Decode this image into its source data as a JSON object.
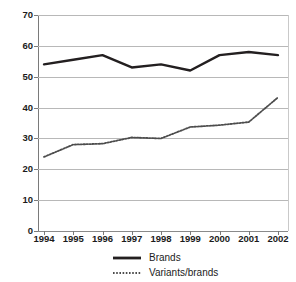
{
  "chart_data": {
    "type": "line",
    "title": "",
    "subtitle": "",
    "xlabel": "",
    "ylabel": "",
    "categories": [
      "1994",
      "1995",
      "1996",
      "1997",
      "1998",
      "1999",
      "2000",
      "2001",
      "2002"
    ],
    "x": [
      1994,
      1995,
      1996,
      1997,
      1998,
      1999,
      2000,
      2001,
      2002
    ],
    "series": [
      {
        "name": "Brands",
        "style": "solid",
        "color": "#231f20",
        "values": [
          54,
          55.5,
          57,
          53,
          54,
          52,
          57,
          58,
          57
        ]
      },
      {
        "name": "Variants/brands",
        "style": "dotted",
        "color": "#4d4d4d",
        "values": [
          24,
          28,
          28.3,
          30.3,
          30,
          33.7,
          34.3,
          35.3,
          43.3
        ]
      }
    ],
    "ylim": [
      0,
      70
    ],
    "yticks": [
      0,
      10,
      20,
      30,
      40,
      50,
      60,
      70
    ],
    "ytick_labels": [
      "0",
      "10",
      "20",
      "30",
      "40",
      "50",
      "60",
      "70"
    ],
    "xtick_labels": [
      "1994",
      "1995",
      "1996",
      "1997",
      "1998",
      "1999",
      "2000",
      "2001",
      "2002"
    ],
    "grid": true,
    "grid_axis": "y",
    "legend_position": "bottom",
    "legend_entries": [
      "Brands",
      "Variants/brands"
    ]
  },
  "colors": {
    "background": "#ffffff",
    "gridline": "#b8b8b8",
    "axis": "#7a7a7a",
    "text": "#1b1b1b",
    "series_brands": "#231f20",
    "series_variants": "#4d4d4d"
  }
}
